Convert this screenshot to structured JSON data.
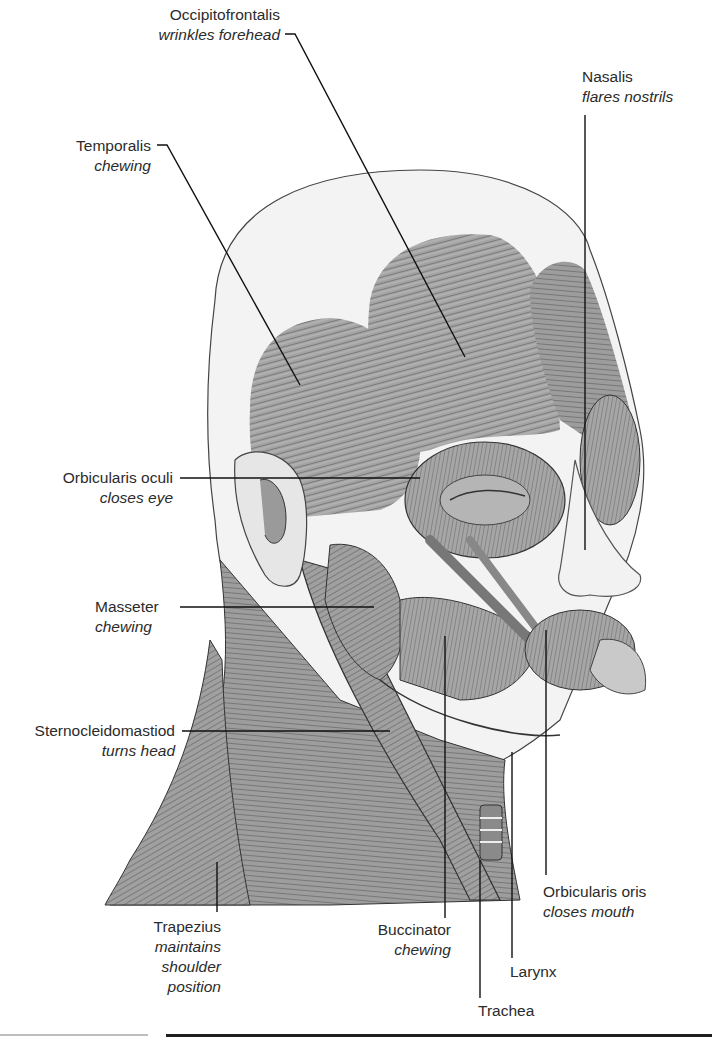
{
  "figure": {
    "colors": {
      "line": "#111111",
      "muscle_fill": "#9a9a9a",
      "muscle_dark": "#6e6e6e",
      "skin": "#eeeeee",
      "text": "#2b2b2b"
    }
  },
  "labels": [
    {
      "id": "occipitofrontalis",
      "name": "Occipitofrontalis",
      "function": "wrinkles forehead"
    },
    {
      "id": "nasalis",
      "name": "Nasalis",
      "function": "flares nostrils"
    },
    {
      "id": "temporalis",
      "name": "Temporalis",
      "function": "chewing"
    },
    {
      "id": "orbicularis-oculi",
      "name": "Orbicularis oculi",
      "function": "closes eye"
    },
    {
      "id": "masseter",
      "name": "Masseter",
      "function": "chewing"
    },
    {
      "id": "sternocleidomastiod",
      "name": "Sternocleidomastiod",
      "function": "turns head"
    },
    {
      "id": "trapezius",
      "name": "Trapezius",
      "function": "maintains shoulder position",
      "function_lines": [
        "maintains",
        "shoulder",
        "position"
      ]
    },
    {
      "id": "buccinator",
      "name": "Buccinator",
      "function": "chewing"
    },
    {
      "id": "orbicularis-oris",
      "name": "Orbicularis oris",
      "function": "closes mouth"
    },
    {
      "id": "larynx",
      "name": "Larynx",
      "function": ""
    },
    {
      "id": "trachea",
      "name": "Trachea",
      "function": ""
    }
  ]
}
